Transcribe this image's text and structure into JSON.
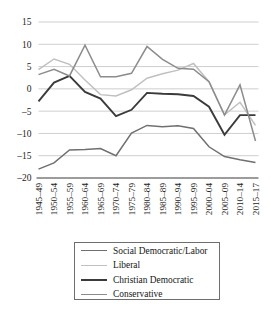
{
  "chart_data": {
    "type": "line",
    "title": "",
    "subtitle": "",
    "xlabel": "",
    "ylabel": "",
    "grid": true,
    "legend_position": "bottom",
    "ylim": [
      -20,
      15
    ],
    "yticks": [
      15,
      10,
      5,
      0,
      -5,
      -10,
      -15,
      -20
    ],
    "ytick_labels": [
      "15",
      "10",
      "5",
      "0",
      "–5",
      "–10",
      "–15",
      "–20"
    ],
    "categories": [
      "1945–49",
      "1950–54",
      "1955–59",
      "1960–64",
      "1965–69",
      "1970–74",
      "1975–79",
      "1980–84",
      "1985–89",
      "1990–94",
      "1995–99",
      "2000–04",
      "2005–09",
      "2010–14",
      "2015–17"
    ],
    "series": [
      {
        "name": "Social Democratic/Labor",
        "color": "#707070",
        "width": 1.5,
        "values": [
          -18.0,
          -16.6,
          -13.7,
          -13.6,
          -13.4,
          -15.0,
          -9.9,
          -8.2,
          -8.5,
          -8.3,
          -8.9,
          -13.0,
          -15.2,
          -15.9,
          -16.5
        ]
      },
      {
        "name": "Liberal",
        "color": "#c0c0c0",
        "width": 1.5,
        "values": [
          4.3,
          6.7,
          5.5,
          2.0,
          -1.3,
          -1.6,
          -0.2,
          2.4,
          3.4,
          4.2,
          5.7,
          1.6,
          -5.8,
          -3.0,
          -8.2
        ]
      },
      {
        "name": "Christian Democratic",
        "color": "#3b3b3b",
        "width": 1.9,
        "values": [
          -2.8,
          1.4,
          2.9,
          -0.7,
          -2.2,
          -6.1,
          -4.7,
          -0.9,
          -1.1,
          -1.2,
          -1.6,
          -4.0,
          -10.3,
          -5.9,
          -5.9
        ]
      },
      {
        "name": "Conservative",
        "color": "#8c8c8c",
        "width": 1.5,
        "values": [
          3.2,
          4.4,
          2.9,
          9.8,
          2.7,
          2.7,
          3.5,
          9.5,
          6.6,
          4.6,
          4.4,
          1.6,
          -5.9,
          0.9,
          -11.7
        ]
      }
    ]
  },
  "legend": {
    "entries": [
      {
        "label": "Social Democratic/Labor",
        "color": "#707070",
        "width": "1.6px"
      },
      {
        "label": "Liberal",
        "color": "#c0c0c0",
        "width": "1.6px"
      },
      {
        "label": "Christian Democratic",
        "color": "#3b3b3b",
        "width": "2.1px"
      },
      {
        "label": "Conservative",
        "color": "#8c8c8c",
        "width": "1.6px"
      }
    ]
  }
}
